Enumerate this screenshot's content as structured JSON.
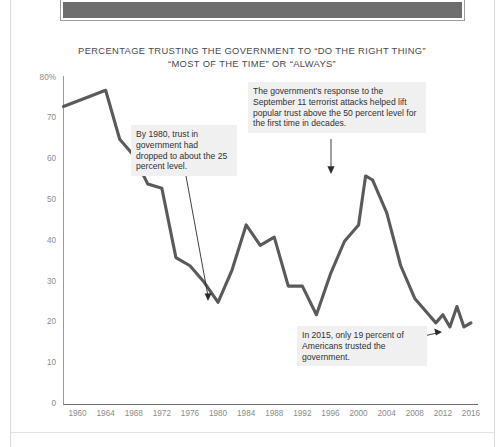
{
  "page": {
    "top_banner_label": "banner-strip"
  },
  "chart_data": {
    "type": "line",
    "title": "PERCENTAGE TRUSTING THE GOVERNMENT TO “DO THE RIGHT THING”\n“MOST OF THE TIME” OR “ALWAYS”",
    "xlabel": "",
    "ylabel": "",
    "xlim": [
      1958,
      2017
    ],
    "ylim": [
      0,
      80
    ],
    "grid": false,
    "legend": "none",
    "line_color": "#5a5a5a",
    "y_ticks": [
      "80%",
      "70",
      "60",
      "50",
      "40",
      "30",
      "20",
      "10",
      "0"
    ],
    "y_tick_values": [
      80,
      70,
      60,
      50,
      40,
      30,
      20,
      10,
      0
    ],
    "x_ticks": [
      "1960",
      "1964",
      "1968",
      "1972",
      "1976",
      "1980",
      "1984",
      "1988",
      "1992",
      "1996",
      "2000",
      "2004",
      "2008",
      "2012",
      "2016"
    ],
    "x_tick_values": [
      1960,
      1964,
      1968,
      1972,
      1976,
      1980,
      1984,
      1988,
      1992,
      1996,
      2000,
      2004,
      2008,
      2012,
      2016
    ],
    "x": [
      1958,
      1964,
      1966,
      1968,
      1970,
      1972,
      1974,
      1976,
      1978,
      1980,
      1982,
      1984,
      1986,
      1988,
      1990,
      1992,
      1994,
      1996,
      1998,
      2000,
      2001,
      2002,
      2004,
      2006,
      2008,
      2010,
      2011,
      2012,
      2013,
      2014,
      2015,
      2016
    ],
    "values": [
      73,
      77,
      65,
      61,
      54,
      53,
      36,
      34,
      30,
      25,
      33,
      44,
      39,
      41,
      29,
      29,
      22,
      32,
      40,
      44,
      56,
      55,
      47,
      34,
      26,
      22,
      20,
      22,
      19,
      24,
      19,
      20
    ],
    "annotations": [
      {
        "id": "a1980",
        "text": "By 1980, trust in government had dropped to about the 25 percent level.",
        "points_to_year": 1980,
        "points_to_value": 25
      },
      {
        "id": "a911",
        "text": "The government’s response to the September 11 terrorist attacks helped lift popular trust above the 50 percent level for the first time in decades.",
        "points_to_year": 2001,
        "points_to_value": 56
      },
      {
        "id": "a2015",
        "text": "In 2015, only 19 percent of Americans trusted the government.",
        "points_to_year": 2015,
        "points_to_value": 19
      }
    ]
  }
}
